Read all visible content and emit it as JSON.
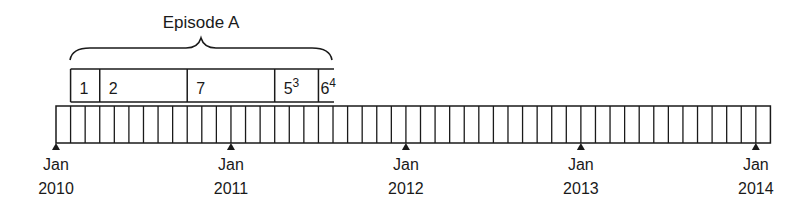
{
  "episode": {
    "title": "Episode A",
    "segments": [
      {
        "label": "1",
        "sup": "",
        "start_month": 1,
        "end_month": 3
      },
      {
        "label": "2",
        "sup": "",
        "start_month": 3,
        "end_month": 9
      },
      {
        "label": "7",
        "sup": "",
        "start_month": 9,
        "end_month": 15
      },
      {
        "label": "5",
        "sup": "3",
        "start_month": 15,
        "end_month": 18
      },
      {
        "label": "6",
        "sup": "4",
        "start_month": 18,
        "end_month": 19
      }
    ]
  },
  "timeline": {
    "months": 49,
    "ticks": [
      {
        "month": 0,
        "line1": "Jan",
        "line2": "2010"
      },
      {
        "month": 12,
        "line1": "Jan",
        "line2": "2011"
      },
      {
        "month": 24,
        "line1": "Jan",
        "line2": "2012"
      },
      {
        "month": 36,
        "line1": "Jan",
        "line2": "2013"
      },
      {
        "month": 48,
        "line1": "Jan",
        "line2": "2014"
      }
    ]
  },
  "colors": {
    "stroke": "#1a1a1a",
    "background": "#ffffff"
  }
}
